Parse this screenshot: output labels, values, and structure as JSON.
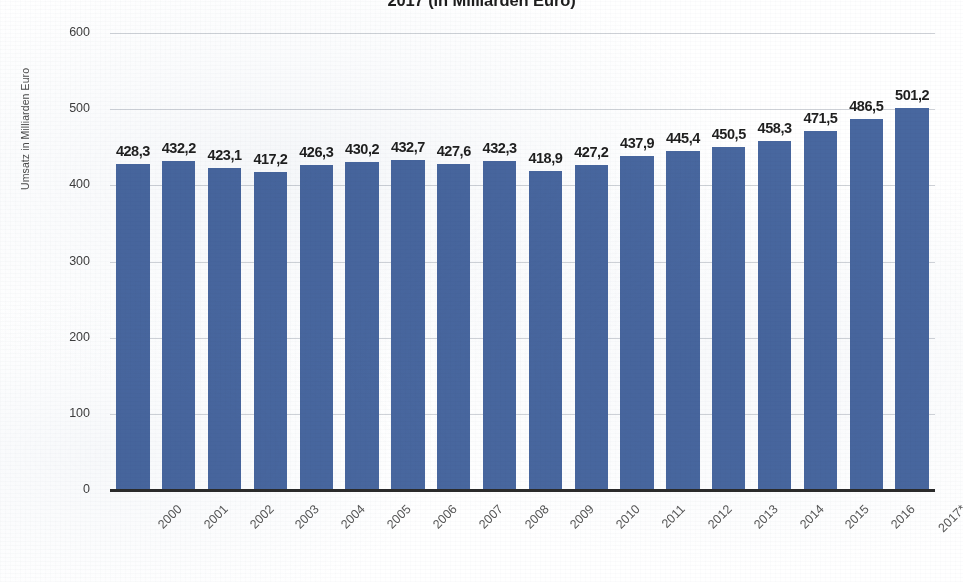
{
  "chart_data": {
    "type": "bar",
    "title": "2017 (in Milliarden Euro)",
    "xlabel": "",
    "ylabel": "Umsatz in Milliarden Euro",
    "ylim": [
      0,
      600
    ],
    "yticks": [
      0,
      100,
      200,
      300,
      400,
      500,
      600
    ],
    "ytick_labels": [
      "0",
      "100",
      "200",
      "300",
      "400",
      "500",
      "600"
    ],
    "grid": true,
    "legend": "none",
    "bar_color": "#48679f",
    "value_label_decimal_separator": ",",
    "categories": [
      "2000",
      "2001",
      "2002",
      "2003",
      "2004",
      "2005",
      "2006",
      "2007",
      "2008",
      "2009",
      "2010",
      "2011",
      "2012",
      "2013",
      "2014",
      "2015",
      "2016",
      "2017*"
    ],
    "values": [
      428.3,
      432.2,
      423.1,
      417.2,
      426.3,
      430.2,
      432.7,
      427.6,
      432.3,
      418.9,
      427.2,
      437.9,
      445.4,
      450.5,
      458.3,
      471.5,
      486.5,
      501.2
    ],
    "value_labels": [
      "428,3",
      "432,2",
      "423,1",
      "417,2",
      "426,3",
      "430,2",
      "432,7",
      "427,6",
      "432,3",
      "418,9",
      "427,2",
      "437,9",
      "445,4",
      "450,5",
      "458,3",
      "471,5",
      "486,5",
      "501,2"
    ]
  }
}
